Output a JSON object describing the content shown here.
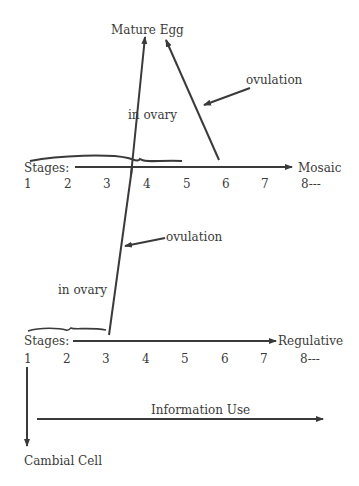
{
  "top": {
    "mature_egg": "Mature Egg",
    "ovulation": "ovulation",
    "in_ovary": "in ovary",
    "stages_label": "Stages:",
    "axis_end": "Mosaic",
    "stage_numbers": [
      "1",
      "2",
      "3",
      "4",
      "5",
      "6",
      "7",
      "8---"
    ]
  },
  "bottom": {
    "ovulation": "ovulation",
    "in_ovary": "in ovary",
    "stages_label": "Stages:",
    "axis_end": "Regulative",
    "stage_numbers": [
      "1",
      "2",
      "3",
      "4",
      "5",
      "6",
      "7",
      "8---"
    ]
  },
  "footer": {
    "information_use": "Information Use",
    "cambial_cell": "Cambial Cell"
  },
  "colors": {
    "ink": "#3a3a3a",
    "background": "#ffffff"
  }
}
